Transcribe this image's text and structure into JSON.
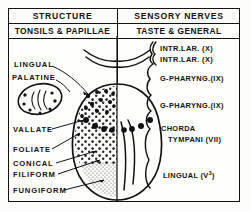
{
  "figure": {
    "type": "anatomical-diagram",
    "columns": 2
  },
  "header": {
    "left_title": "STRUCTURE",
    "right_title": "SENSORY NERVES",
    "left_subtitle": "TONSILS & PAPILLAE",
    "right_subtitle": "TASTE & GENERAL"
  },
  "structures": [
    {
      "label": "LINGUAL",
      "x": 14,
      "y": 64
    },
    {
      "label": "PALATINE",
      "x": 12,
      "y": 77
    },
    {
      "label": "VALLATE",
      "x": 13,
      "y": 130
    },
    {
      "label": "FOLIATE",
      "x": 13,
      "y": 150
    },
    {
      "label": "CONICAL",
      "x": 13,
      "y": 164
    },
    {
      "label": "FILIFORM",
      "x": 13,
      "y": 175
    },
    {
      "label": "FUNGIFORM",
      "x": 13,
      "y": 191
    }
  ],
  "nerves": [
    {
      "label": "INTR.LAR. (X)",
      "sup": "",
      "x": 160,
      "y": 48
    },
    {
      "label": "INTR.LAR. (X)",
      "sup": "",
      "x": 160,
      "y": 59
    },
    {
      "label": "G-PHARYNG.(IX)",
      "sup": "",
      "x": 160,
      "y": 78
    },
    {
      "label": "G-PHARYNG.(IX)",
      "sup": "",
      "x": 160,
      "y": 105
    },
    {
      "label": "CHORDA",
      "sup": "",
      "x": 161,
      "y": 128
    },
    {
      "label": "TYMPANI (VII)",
      "sup": "",
      "x": 168,
      "y": 139
    },
    {
      "label": "LINGUAL (V",
      "sup": "3",
      "x": 163,
      "y": 174
    }
  ],
  "colors": {
    "ink": "#111111",
    "paper": "#fefefd",
    "stipple": "#222222"
  }
}
